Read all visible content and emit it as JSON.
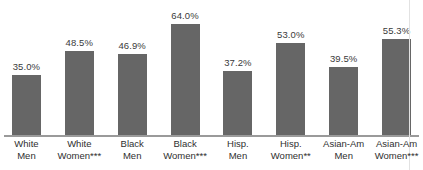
{
  "chart_data": {
    "type": "bar",
    "title": "",
    "subtitle": "",
    "xlabel": "",
    "ylabel": "",
    "categories": [
      "White Men",
      "White Women***",
      "Black Men",
      "Black Women***",
      "Hisp. Men",
      "Hisp. Women**",
      "Asian-Am Men",
      "Asian-Am Women***"
    ],
    "category_lines": [
      [
        "White",
        "Men"
      ],
      [
        "White",
        "Women***"
      ],
      [
        "Black",
        "Men"
      ],
      [
        "Black",
        "Women***"
      ],
      [
        "Hisp.",
        "Men"
      ],
      [
        "Hisp.",
        "Women**"
      ],
      [
        "Asian-Am",
        "Men"
      ],
      [
        "Asian-Am",
        "Women***"
      ]
    ],
    "values": [
      35.0,
      48.5,
      46.9,
      64.0,
      37.2,
      53.0,
      39.5,
      55.3
    ],
    "value_labels": [
      "35.0%",
      "48.5%",
      "46.9%",
      "64.0%",
      "37.2%",
      "53.0%",
      "39.5%",
      "55.3%"
    ],
    "ylim": [
      0,
      64
    ],
    "grid": false,
    "legend": null,
    "bar_color": "#666666",
    "axis_color": "#9a9a9a",
    "text_color": "#2f2f2f",
    "background": "#ffffff"
  }
}
